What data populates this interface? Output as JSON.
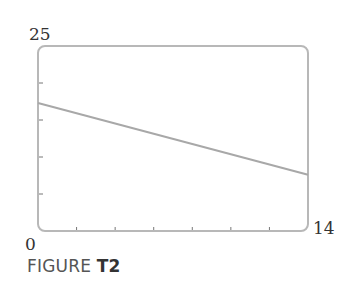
{
  "chart_data": {
    "type": "line",
    "title": "",
    "xlabel": "",
    "ylabel": "",
    "xlim": [
      0,
      14
    ],
    "ylim": [
      0,
      25
    ],
    "x_tick_labels": [
      "0",
      "14"
    ],
    "y_tick_labels": [
      "25"
    ],
    "x_ticks": [
      2,
      4,
      6,
      8,
      10,
      12
    ],
    "y_ticks": [
      5,
      10,
      15,
      20
    ],
    "grid": false,
    "legend": null,
    "series": [
      {
        "name": "line",
        "x": [
          0,
          14
        ],
        "y": [
          17.3,
          7.6
        ]
      }
    ]
  },
  "labels": {
    "y_max": "25",
    "x_min": "0",
    "x_max": "14"
  },
  "caption": {
    "prefix": "FIGURE ",
    "id": "T2"
  },
  "colors": {
    "frame": "#b8b8b8",
    "line": "#a8a8a8",
    "ticks": "#777777"
  }
}
